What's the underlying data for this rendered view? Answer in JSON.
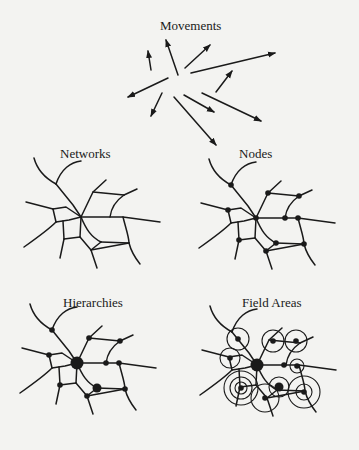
{
  "figure": {
    "panels": [
      {
        "id": "movements",
        "label": "Movements"
      },
      {
        "id": "networks",
        "label": "Networks"
      },
      {
        "id": "nodes",
        "label": "Nodes"
      },
      {
        "id": "hierarchies",
        "label": "Hierarchies"
      },
      {
        "id": "field-areas",
        "label": "Field Areas"
      }
    ]
  }
}
